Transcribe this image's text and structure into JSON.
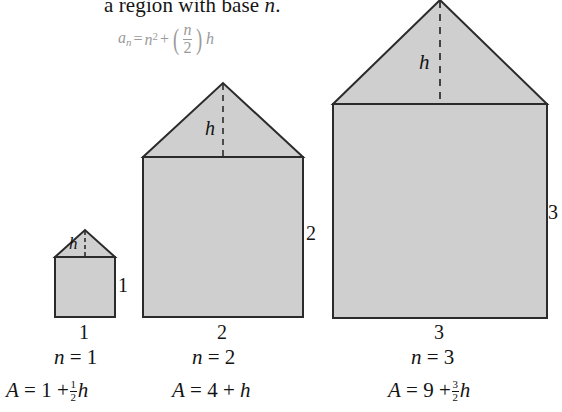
{
  "figure": {
    "top_text": {
      "line": "a region with base n.",
      "italic_symbol": "n",
      "prefix": "a region with base "
    },
    "general_formula": {
      "lhs_base": "a",
      "lhs_sub": "n",
      "equals": "=",
      "term1_base": "n",
      "term1_exp": "2",
      "plus": "+",
      "frac_num": "n",
      "frac_den": "2",
      "trailing": "h"
    },
    "fill_color": "#cfcfcf",
    "stroke_color": "#2b2b2b",
    "houses": [
      {
        "id": "house-1",
        "base_label": "1",
        "side_label": "1",
        "height_label": "h",
        "n_caption_prefix": "n",
        "n_caption_value": "1",
        "area_prefix": "A",
        "area_square_term": "1",
        "area_frac_num": "1",
        "area_frac_den": "2",
        "area_suffix": "h"
      },
      {
        "id": "house-2",
        "base_label": "2",
        "side_label": "2",
        "height_label": "h",
        "n_caption_prefix": "n",
        "n_caption_value": "2",
        "area_prefix": "A",
        "area_square_term": "4",
        "area_frac_num": "",
        "area_frac_den": "",
        "area_suffix": "h"
      },
      {
        "id": "house-3",
        "base_label": "3",
        "side_label": "3",
        "height_label": "h",
        "n_caption_prefix": "n",
        "n_caption_value": "3",
        "area_prefix": "A",
        "area_square_term": "9",
        "area_frac_num": "3",
        "area_frac_den": "2",
        "area_suffix": "h"
      }
    ],
    "symbols": {
      "equals": "=",
      "plus": "+"
    }
  }
}
